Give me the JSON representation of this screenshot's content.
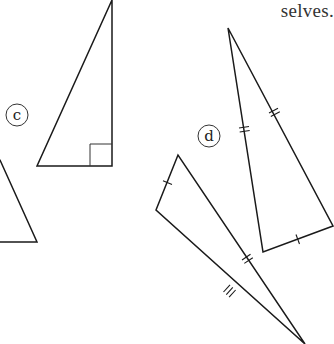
{
  "caption": {
    "text": "selves."
  },
  "labels": {
    "c": "c",
    "d": "d"
  },
  "colors": {
    "line": "#1a1a1a",
    "text": "#333333",
    "background": "#ffffff"
  },
  "shapes": {
    "partial_triangle_left": {
      "description": "Partially visible triangle at left edge",
      "points": [
        [
          0,
          160
        ],
        [
          37,
          242
        ],
        [
          0,
          242
        ]
      ]
    },
    "triangle_c": {
      "label": "c",
      "type": "right triangle",
      "points": [
        [
          112,
          0
        ],
        [
          37,
          166
        ],
        [
          112,
          166
        ]
      ],
      "right_angle_at": [
        112,
        166
      ]
    },
    "triangle_d_tall": {
      "label": "d",
      "points": [
        [
          228,
          28
        ],
        [
          263,
          252
        ],
        [
          333,
          226
        ]
      ],
      "tick_marks": {
        "left_side": 2,
        "right_side": 2,
        "base": 1
      }
    },
    "triangle_d_long": {
      "label": "d",
      "points": [
        [
          178,
          155
        ],
        [
          156,
          210
        ],
        [
          305,
          344
        ]
      ],
      "tick_marks": {
        "short_side": 1,
        "upper_long_side": 2,
        "lower_long_side": 3
      }
    }
  }
}
